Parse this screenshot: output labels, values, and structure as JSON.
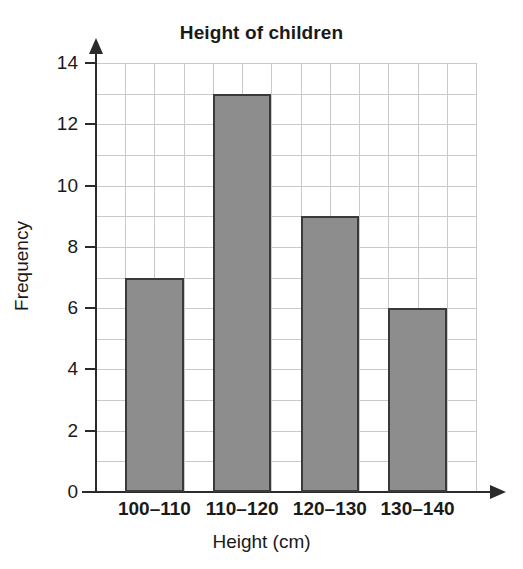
{
  "chart_data": {
    "type": "bar",
    "title": "Height of children",
    "xlabel": "Height (cm)",
    "ylabel": "Frequency",
    "categories": [
      "100–110",
      "110–120",
      "120–130",
      "130–140"
    ],
    "values": [
      7,
      13,
      9,
      6
    ],
    "series": [
      {
        "name": "Frequency",
        "values": [
          7,
          13,
          9,
          6
        ]
      }
    ],
    "ylim": [
      0,
      14
    ],
    "xlim_note": "categorical",
    "ytick_labels": [
      "0",
      "2",
      "4",
      "6",
      "8",
      "10",
      "12",
      "14"
    ],
    "ytick_values": [
      0,
      2,
      4,
      6,
      8,
      10,
      12,
      14
    ],
    "ytick_step": 2,
    "minor_gridline_step": 1,
    "grid": "both",
    "grid_columns": 13,
    "grid_rows": 14,
    "legend": "none",
    "annotations": [],
    "colors": {
      "bar_fill": "#8d8d8d",
      "bar_border": "#3a3a3a",
      "gridline": "#c9c9c9",
      "axis": "#2b2b2b",
      "text": "#1a1a1a",
      "background": "#ffffff"
    }
  }
}
